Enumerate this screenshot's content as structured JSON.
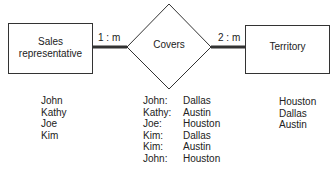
{
  "entities": {
    "left": {
      "label_line1": "Sales",
      "label_line2": "representative"
    },
    "relationship": {
      "label": "Covers"
    },
    "right": {
      "label": "Territory"
    }
  },
  "cardinalities": {
    "left": "1 : m",
    "right": "2 : m"
  },
  "lists": {
    "sales_reps": [
      "John",
      "Kathy",
      "Joe",
      "Kim"
    ],
    "covers": [
      {
        "rep": "John:",
        "territory": "Dallas"
      },
      {
        "rep": "Kathy:",
        "territory": "Austin"
      },
      {
        "rep": "Joe:",
        "territory": "Houston"
      },
      {
        "rep": "Kim:",
        "territory": "Dallas"
      },
      {
        "rep": "Kim:",
        "territory": "Austin"
      },
      {
        "rep": "John:",
        "territory": "Houston"
      }
    ],
    "territories": [
      "Houston",
      "Dallas",
      "Austin"
    ]
  }
}
